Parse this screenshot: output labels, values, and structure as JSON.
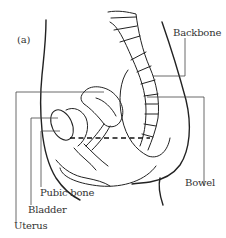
{
  "figure": {
    "panel_label": "(a)",
    "labels": {
      "backbone": "Backbone",
      "bowel": "Bowel",
      "pubic_bone": "Pubic bone",
      "bladder": "Bladder",
      "uterus": "Uterus"
    },
    "colors": {
      "line": "#222222",
      "background": "#ffffff",
      "text": "#333333"
    }
  }
}
